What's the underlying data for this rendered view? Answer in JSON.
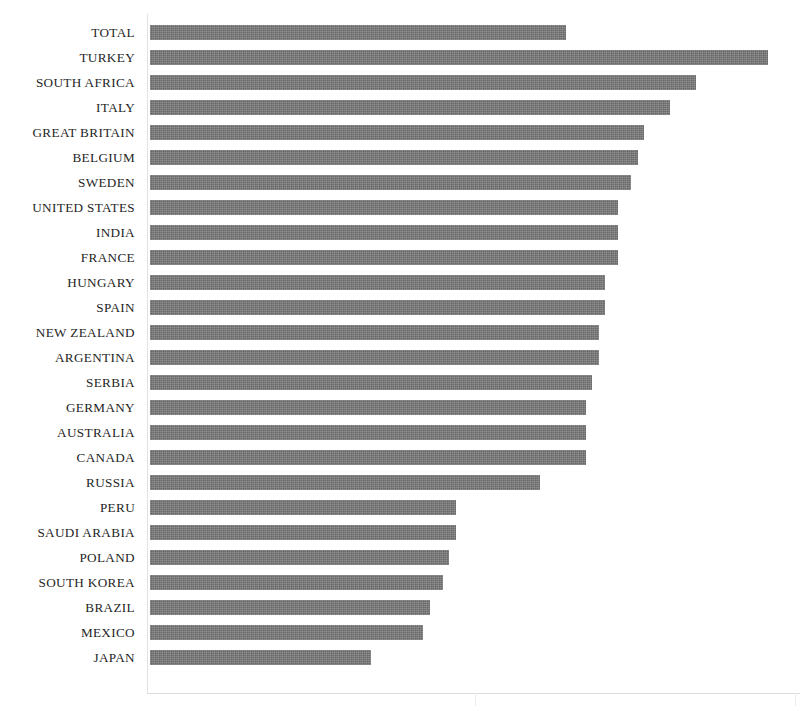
{
  "chart": {
    "title": "",
    "title_note": "cropped-off-top-of-image",
    "bar_color": "#767676",
    "axis_color": "#dcdcdc",
    "background": "#ffffff"
  },
  "chart_data": {
    "type": "bar",
    "orientation": "horizontal",
    "title": "",
    "xlabel": "",
    "ylabel": "",
    "xlim": [
      0,
      100
    ],
    "grid": false,
    "legend": null,
    "categories": [
      "TOTAL",
      "TURKEY",
      "SOUTH AFRICA",
      "ITALY",
      "GREAT BRITAIN",
      "BELGIUM",
      "SWEDEN",
      "UNITED STATES",
      "INDIA",
      "FRANCE",
      "HUNGARY",
      "SPAIN",
      "NEW ZEALAND",
      "ARGENTINA",
      "SERBIA",
      "GERMANY",
      "AUSTRALIA",
      "CANADA",
      "RUSSIA",
      "PERU",
      "SAUDI ARABIA",
      "POLAND",
      "SOUTH KOREA",
      "BRAZIL",
      "MEXICO",
      "JAPAN"
    ],
    "values": [
      64,
      95,
      84,
      80,
      76,
      75,
      74,
      72,
      72,
      72,
      70,
      70,
      69,
      69,
      68,
      67,
      67,
      67,
      60,
      47,
      47,
      46,
      45,
      43,
      42,
      34
    ],
    "bars": [
      {
        "label": "TOTAL",
        "value": 64
      },
      {
        "label": "TURKEY",
        "value": 95
      },
      {
        "label": "SOUTH AFRICA",
        "value": 84
      },
      {
        "label": "ITALY",
        "value": 80
      },
      {
        "label": "GREAT BRITAIN",
        "value": 76
      },
      {
        "label": "BELGIUM",
        "value": 75
      },
      {
        "label": "SWEDEN",
        "value": 74
      },
      {
        "label": "UNITED STATES",
        "value": 72
      },
      {
        "label": "INDIA",
        "value": 72
      },
      {
        "label": "FRANCE",
        "value": 72
      },
      {
        "label": "HUNGARY",
        "value": 70
      },
      {
        "label": "SPAIN",
        "value": 70
      },
      {
        "label": "NEW ZEALAND",
        "value": 69
      },
      {
        "label": "ARGENTINA",
        "value": 69
      },
      {
        "label": "SERBIA",
        "value": 68
      },
      {
        "label": "GERMANY",
        "value": 67
      },
      {
        "label": "AUSTRALIA",
        "value": 67
      },
      {
        "label": "CANADA",
        "value": 67
      },
      {
        "label": "RUSSIA",
        "value": 60
      },
      {
        "label": "PERU",
        "value": 47
      },
      {
        "label": "SAUDI ARABIA",
        "value": 47
      },
      {
        "label": "POLAND",
        "value": 46
      },
      {
        "label": "SOUTH KOREA",
        "value": 45
      },
      {
        "label": "BRAZIL",
        "value": 43
      },
      {
        "label": "MEXICO",
        "value": 42
      },
      {
        "label": "JAPAN",
        "value": 34
      }
    ]
  }
}
